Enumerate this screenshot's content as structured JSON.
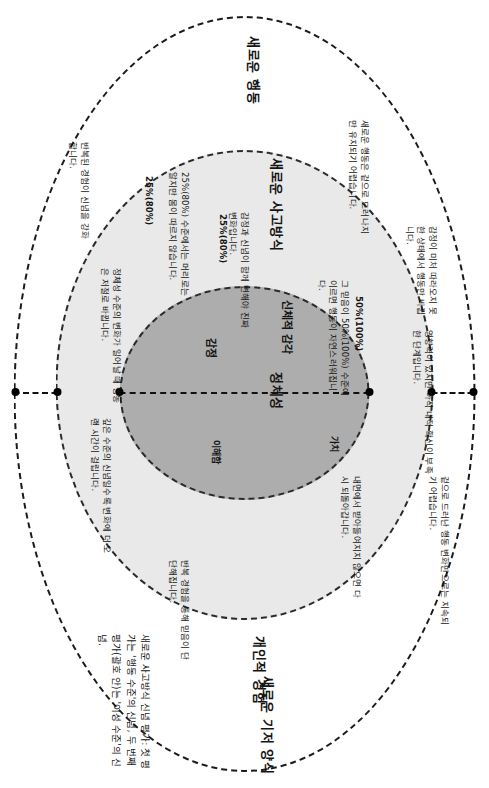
{
  "diagram": {
    "zones": {
      "behavior": "새로운 행동",
      "thinking": "새로운 사고방식",
      "identity": "정체성",
      "sensation": "신체적 감각",
      "experience": "개인적 경험",
      "new_base": "새로운 기저 양식"
    },
    "core_words": {
      "emotion": "감정",
      "value": "가치",
      "feeling": "이해함"
    },
    "percent_labels": {
      "inner": "25%(80%)",
      "middle": "50%(100%)",
      "lower": "25%(80%)"
    },
    "notes": {
      "top_a": "영향력이 있지만 아직 내적 확신이 부족한 단계입니다.",
      "top_b": "감정이 미처 따라오지 못한 상태에서 행동만 바뀝니다.",
      "top_c": "새로운 행동은 겉으로 드러나지만 유지되기 어렵습니다.",
      "right_a": "겉으로 드러난 행동 변화만으로는 지속되기 어렵습니다.",
      "right_b": "내면에서 받아들여지지 않으면 다시 되돌아갑니다.",
      "mid_a": "그 믿음이 50%(100%) 수준에 이르면 행동이 자연스러워집니다.",
      "mid_b": "감정과 신념이 함께 변해야 진짜 변화입니다.",
      "bot_a": "25%(80%) 수준에서는 머리로는 알지만 몸이 따르지 않습니다.",
      "bot_b": "반복된 경험이 신념을 강화합니다.",
      "bot_c": "정체성 수준의 변화가 일어날 때 행동은 저절로 바뀝니다.",
      "bot_d": "깊은 수준의 신념일수록 변화에 더 오랜 시간이 걸립니다.",
      "right_c": "반복 경험을 통해 믿음이 단단해집니다."
    },
    "caption": "새로운 사고방식 신념 평가: 첫 평가는 '행동 수준'의 신념, 두 번째 평가(괄호 안)는 '이성 수준'의 신념."
  }
}
